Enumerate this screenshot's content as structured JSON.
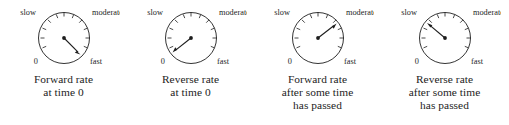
{
  "figure": {
    "type": "gauge-series",
    "background": "#ffffff",
    "ink_color": "#1d1d1d",
    "panel_count": 4
  },
  "gauge_labels": {
    "top_left": "slow",
    "top_right": "moderate",
    "bottom_left": "0",
    "bottom_right": "fast"
  },
  "panels": [
    {
      "id": "forward-rate-time-0",
      "needle_angle_deg": 315,
      "needle_direction": "down-right",
      "needle_points_to": "fast",
      "caption_lines": [
        "Forward rate",
        "at time 0"
      ]
    },
    {
      "id": "reverse-rate-time-0",
      "needle_angle_deg": 218,
      "needle_direction": "down-left",
      "needle_points_to": "0",
      "caption_lines": [
        "Reverse rate",
        "at time 0"
      ]
    },
    {
      "id": "forward-rate-after-time",
      "needle_angle_deg": 38,
      "needle_direction": "up-right",
      "needle_points_to": "moderate",
      "caption_lines": [
        "Forward rate",
        "after some time",
        "has passed"
      ]
    },
    {
      "id": "reverse-rate-after-time",
      "needle_angle_deg": 143,
      "needle_direction": "up-left",
      "needle_points_to": "slow",
      "caption_lines": [
        "Reverse rate",
        "after some time",
        "has passed"
      ]
    }
  ]
}
